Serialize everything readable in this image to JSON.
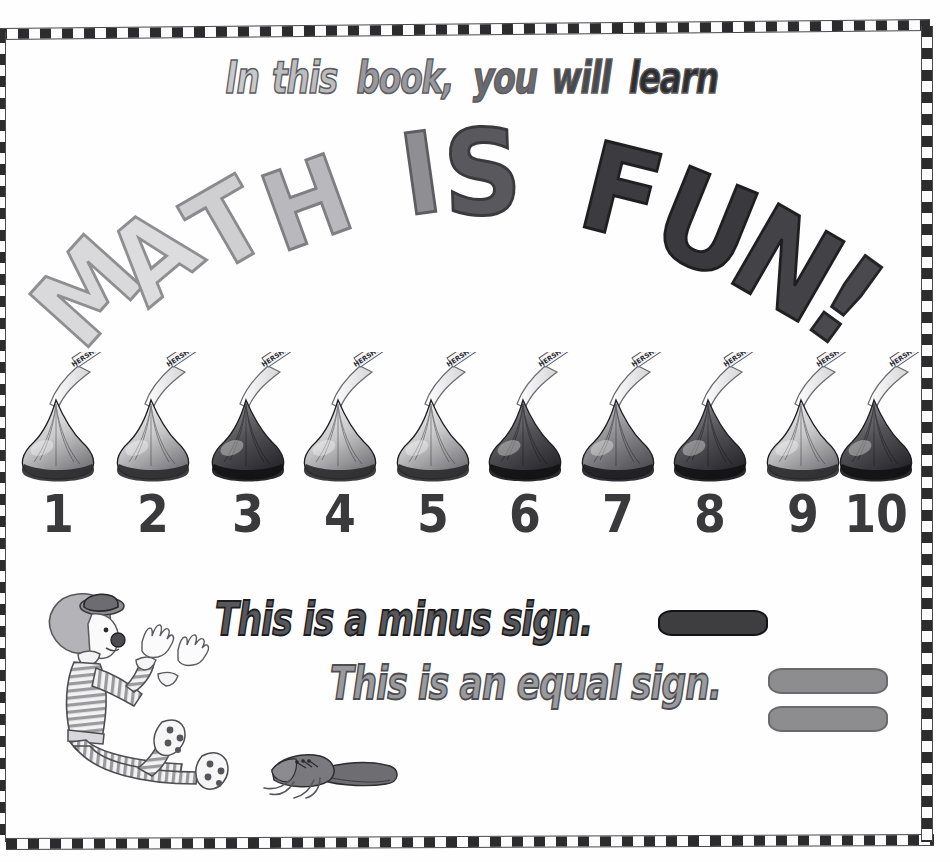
{
  "page": {
    "background_color": "#ffffff",
    "border_style": "checkered black and white"
  },
  "header": {
    "words": [
      {
        "text": "In",
        "color": "#c9c9cc"
      },
      {
        "text": "this",
        "color": "#bdbdc0"
      },
      {
        "text": "book,",
        "color": "#99999d"
      },
      {
        "text": "you",
        "color": "#6b6b6f"
      },
      {
        "text": "will",
        "color": "#4a4a4e"
      },
      {
        "text": "learn",
        "color": "#2e2e31"
      }
    ],
    "full_text": "In this book, you will learn"
  },
  "title": {
    "full_text": "MATH IS FUN!",
    "letters": [
      {
        "char": "M",
        "x": 34,
        "y": 128,
        "size": 108,
        "rot": -48,
        "fill": "#d9d9dc",
        "stroke": "#8e8e93"
      },
      {
        "char": "A",
        "x": 112,
        "y": 92,
        "size": 108,
        "rot": -40,
        "fill": "#dcdcdf",
        "stroke": "#8e8e93"
      },
      {
        "char": "T",
        "x": 190,
        "y": 62,
        "size": 108,
        "rot": -30,
        "fill": "#cfcfd2",
        "stroke": "#8a8a8f"
      },
      {
        "char": "H",
        "x": 262,
        "y": 40,
        "size": 108,
        "rot": -20,
        "fill": "#b9b9bd",
        "stroke": "#7e7e83"
      },
      {
        "char": "I",
        "x": 400,
        "y": 8,
        "size": 112,
        "rot": -8,
        "fill": "#8e8e93",
        "stroke": "#5c5c61"
      },
      {
        "char": "S",
        "x": 440,
        "y": 4,
        "size": 118,
        "rot": -2,
        "fill": "#59595d",
        "stroke": "#3a3a3e"
      },
      {
        "char": "F",
        "x": 580,
        "y": 22,
        "size": 122,
        "rot": 14,
        "fill": "#3c3c40",
        "stroke": "#1f1f22"
      },
      {
        "char": "U",
        "x": 654,
        "y": 52,
        "size": 126,
        "rot": 22,
        "fill": "#3a3a3e",
        "stroke": "#1f1f22"
      },
      {
        "char": "N",
        "x": 734,
        "y": 92,
        "size": 126,
        "rot": 30,
        "fill": "#434347",
        "stroke": "#1f1f22"
      },
      {
        "char": "!",
        "x": 816,
        "y": 128,
        "size": 126,
        "rot": 36,
        "fill": "#4a4a4e",
        "stroke": "#242427"
      }
    ]
  },
  "kisses": {
    "wrapper_label": "HERSHEY'S",
    "items": [
      {
        "number": "1",
        "x": 10,
        "shade": "light"
      },
      {
        "number": "2",
        "x": 105,
        "shade": "light"
      },
      {
        "number": "3",
        "x": 200,
        "shade": "dark"
      },
      {
        "number": "4",
        "x": 292,
        "shade": "light"
      },
      {
        "number": "5",
        "x": 385,
        "shade": "light"
      },
      {
        "number": "6",
        "x": 477,
        "shade": "dark"
      },
      {
        "number": "7",
        "x": 570,
        "shade": "medium"
      },
      {
        "number": "8",
        "x": 662,
        "shade": "dark"
      },
      {
        "number": "9",
        "x": 755,
        "shade": "light"
      },
      {
        "number": "10",
        "x": 828,
        "shade": "dark"
      }
    ]
  },
  "statements": {
    "minus": {
      "text": "This is a minus sign.",
      "sign_name": "minus-sign",
      "sign_color": "#3e3e40",
      "text_color": "#57575a"
    },
    "equal": {
      "text": "This is an equal sign.",
      "sign_name": "equal-sign",
      "sign_color": "#8d8d90",
      "text_color": "#9a9a9d"
    }
  },
  "illustrations": {
    "clown": "clown sitting with legs out, striped outfit, polka-dot socks, bowler hat",
    "shoes": "pair of oversized clown shoes with loose laces"
  }
}
